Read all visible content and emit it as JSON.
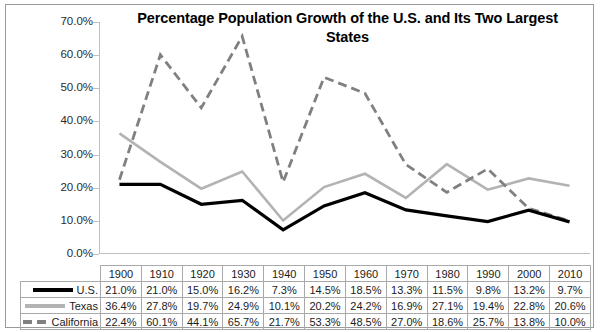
{
  "chart_data": {
    "type": "line",
    "title": "Percentage Population Growth of the U.S. and Its Two Largest States",
    "xlabel": "",
    "ylabel": "",
    "ylim": [
      0,
      70
    ],
    "ytick_labels": [
      "70.0%",
      "60.0%",
      "50.0%",
      "40.0%",
      "30.0%",
      "20.0%",
      "10.0%",
      "0.0%"
    ],
    "ytick_values": [
      70,
      60,
      50,
      40,
      30,
      20,
      10,
      0
    ],
    "grid": false,
    "legend_position": "table-left",
    "categories": [
      "1900",
      "1910",
      "1920",
      "1930",
      "1940",
      "1950",
      "1960",
      "1970",
      "1980",
      "1990",
      "2000",
      "2010"
    ],
    "series": [
      {
        "name": "U.S.",
        "style": "solid",
        "color": "#000000",
        "values": [
          21.0,
          21.0,
          15.0,
          16.2,
          7.3,
          14.5,
          18.5,
          13.3,
          11.5,
          9.8,
          13.2,
          9.7
        ],
        "labels": [
          "21.0%",
          "21.0%",
          "15.0%",
          "16.2%",
          "7.3%",
          "14.5%",
          "18.5%",
          "13.3%",
          "11.5%",
          "9.8%",
          "13.2%",
          "9.7%"
        ]
      },
      {
        "name": "Texas",
        "style": "solid",
        "color": "#b3b3b3",
        "values": [
          36.4,
          27.8,
          19.7,
          24.9,
          10.1,
          20.2,
          24.2,
          16.9,
          27.1,
          19.4,
          22.8,
          20.6
        ],
        "labels": [
          "36.4%",
          "27.8%",
          "19.7%",
          "24.9%",
          "10.1%",
          "20.2%",
          "24.2%",
          "16.9%",
          "27.1%",
          "19.4%",
          "22.8%",
          "20.6%"
        ]
      },
      {
        "name": "California",
        "style": "dashed",
        "color": "#808080",
        "values": [
          22.4,
          60.1,
          44.1,
          65.7,
          21.7,
          53.3,
          48.5,
          27.0,
          18.6,
          25.7,
          13.8,
          10.0
        ],
        "labels": [
          "22.4%",
          "60.1%",
          "44.1%",
          "65.7%",
          "21.7%",
          "53.3%",
          "48.5%",
          "27.0%",
          "18.6%",
          "25.7%",
          "13.8%",
          "10.0%"
        ]
      }
    ]
  },
  "table": {
    "legend_labels": [
      "U.S.",
      "Texas",
      "California"
    ]
  }
}
